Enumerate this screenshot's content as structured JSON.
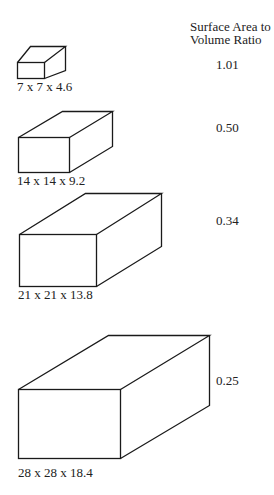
{
  "header": {
    "line1": "Surface Area to",
    "line2": "Volume Ratio"
  },
  "boxes": [
    {
      "dims": "7 x 7 x 4.6",
      "ratio": "1.01"
    },
    {
      "dims": "14 x 14 x 9.2",
      "ratio": "0.50"
    },
    {
      "dims": "21 x 21 x 13.8",
      "ratio": "0.34"
    },
    {
      "dims": "28 x 28 x 18.4",
      "ratio": "0.25"
    }
  ]
}
